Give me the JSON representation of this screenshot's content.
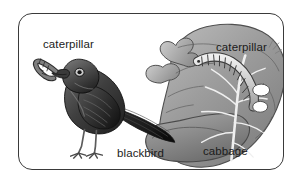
{
  "figure": {
    "border_color": "#3a3a3a",
    "background_color": "#ffffff",
    "ink_color": "#1b1b1b"
  },
  "labels": {
    "caterpillar_bird": "caterpillar",
    "blackbird": "blackbird",
    "caterpillar_leaf": "caterpillar",
    "cabbage": "cabbage"
  },
  "illustrations": {
    "blackbird": "blackbird-illustration",
    "caterpillar_in_beak": "caterpillar-in-beak-illustration",
    "cabbage_leaf": "cabbage-leaf-illustration",
    "caterpillar_on_leaf": "caterpillar-on-leaf-illustration"
  },
  "palette": {
    "bird_dark": "#2b2b2b",
    "bird_mid": "#5a5a5a",
    "bird_light": "#8d8d8d",
    "leaf_dark": "#6f6f6f",
    "leaf_mid": "#9a9a9a",
    "leaf_light": "#c3c3c3",
    "vein": "#e8e8e8",
    "caterpillar_body": "#d2d2d2",
    "caterpillar_outline": "#3c3c3c"
  }
}
